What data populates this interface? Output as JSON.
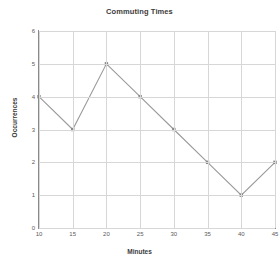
{
  "chart_data": {
    "type": "line",
    "title": "Commuting Times",
    "xlabel": "Minutes",
    "ylabel": "Occurrences",
    "x": [
      10,
      15,
      20,
      25,
      30,
      35,
      40,
      45
    ],
    "values": [
      4,
      3,
      5,
      4,
      3,
      2,
      1,
      2
    ],
    "series": [
      {
        "name": "Occurrences",
        "values": [
          4,
          3,
          5,
          4,
          3,
          2,
          1,
          2
        ]
      }
    ],
    "xticks": [
      10,
      15,
      20,
      25,
      30,
      35,
      40,
      45
    ],
    "yticks": [
      0,
      1,
      2,
      3,
      4,
      5,
      6
    ],
    "xlim": [
      10,
      45
    ],
    "ylim": [
      0,
      6
    ],
    "grid": true,
    "legend": false,
    "line_color": "#9a9a9a",
    "marker_color": "#888888",
    "marker": "square",
    "grid_color": "#d7d7d7",
    "axis_color": "#8a8a8a",
    "background": "#ffffff",
    "title_color": "#3b3b3b",
    "tick_label_color": "#5a5a5a"
  }
}
